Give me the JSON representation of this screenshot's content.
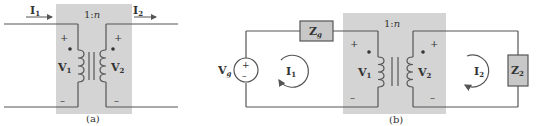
{
  "figure_a": {
    "caption": "(a)",
    "ratio_prefix": "1:",
    "ratio_n": "n",
    "current_in": {
      "main": "I",
      "sub": "1"
    },
    "current_out": {
      "main": "I",
      "sub": "2"
    },
    "primary_voltage": {
      "main": "V",
      "sub": "1"
    },
    "secondary_voltage": {
      "main": "V",
      "sub": "2"
    },
    "plus": "+",
    "minus": "–"
  },
  "figure_b": {
    "caption": "(b)",
    "ratio_prefix": "1:",
    "ratio_n": "n",
    "source": {
      "main": "V",
      "sub": "g",
      "plus": "+",
      "minus": "–"
    },
    "source_impedance": {
      "main": "Z",
      "sub": "g"
    },
    "load_impedance": {
      "main": "Z",
      "sub": "2"
    },
    "mesh_current_1": {
      "main": "I",
      "sub": "1"
    },
    "mesh_current_2": {
      "main": "I",
      "sub": "2"
    },
    "primary_voltage": {
      "main": "V",
      "sub": "1"
    },
    "secondary_voltage": {
      "main": "V",
      "sub": "2"
    },
    "plus": "+",
    "minus": "–"
  },
  "colors": {
    "shade": "#d4d4d4",
    "wire": "#555555",
    "box_fill": "#c8c8c8",
    "text": "#333333"
  }
}
